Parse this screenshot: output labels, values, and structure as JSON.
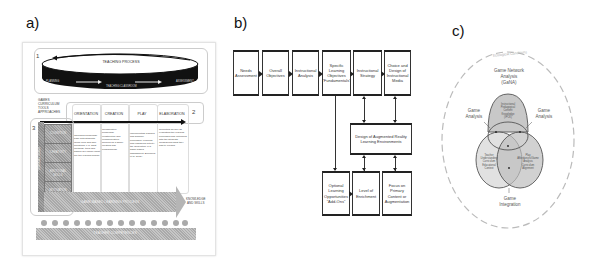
{
  "panels": {
    "a": {
      "label": "a)",
      "step_numbers": [
        "1",
        "2",
        "3"
      ],
      "disc": {
        "title": "TEACHING PROCESS",
        "bottom_label": "TEACHING CLASSROOM",
        "left_label": "PLANNING",
        "right_label": "ASSESSMENT"
      },
      "left_header": [
        "GAMES",
        "CURRICULUM",
        "TOOLS",
        "APPROACHES"
      ],
      "columns": [
        "ORIENTATION",
        "CREATION",
        "PLAY",
        "ELABORATION"
      ],
      "side_vertical_label": "LEARNING GOALS",
      "side_cells": [
        "COGNITION",
        "CREATIVITY",
        "EMOTIONAL SKILLS",
        "MOTIVATION SKILLS"
      ],
      "column_texts": [
        "Choosing knowledge base with students' ideas; how and who questions, e.g. what methods, tools and games are used? What are the learning goals?",
        "Collaborative knowledge construction and communication: working as a game-creating and programming.",
        "Implementing planned and gameful processes. Learning and reshaping activity; the generation (e.g. game-based assessment; Bleumers et al. 2011)",
        "Reflecting as well as evaluating the learning processes and outcomes with the students. Considering what they had to expand."
      ],
      "big_arrow_label": "GAME-BASED LEARNING PROCESS",
      "arrow_end_label": [
        "KNOWLEDGE",
        "AND SKILLS"
      ],
      "bottom_bar_label": "TEACHER COMPETENCES",
      "star_count": 14
    },
    "b": {
      "label": "b)",
      "top_row": [
        "Needs Assessment",
        "Overall Objectives",
        "Instructional Analysis",
        "Specific Learning Objectives \"Fundamentals\"",
        "Instructional Strategy",
        "Choice and Design of Instructional Media"
      ],
      "center_box": "Design of Augmented Reality Learning Environments",
      "bottom_row": [
        "Optional Learning Opportunities \"Add-Ons\"",
        "Level of Enrichment",
        "Focus on Primary Content or Augmentation"
      ]
    },
    "c": {
      "label": "c)",
      "outer_label": "Ecological Conditions",
      "top_title": [
        "Game Network",
        "Analysis",
        "(GaNA)"
      ],
      "left_label": [
        "Game",
        "Analysis"
      ],
      "right_label": [
        "Game",
        "Analysis"
      ],
      "bottom_label": [
        "Game",
        "Integration"
      ],
      "top_circle_text": [
        "Instructional",
        "Pedagogical",
        "Content",
        "Knowledge",
        "(IPCK)"
      ],
      "left_circle_text": [
        "Teacher",
        "Understanding",
        "Curriculum",
        "Educational",
        "Context"
      ],
      "right_circle_text": [
        "Play",
        "Affordances/Game",
        "Analysis",
        "Curriculum",
        "Alignment"
      ],
      "colors": {
        "top_fill": "#c8c8c8",
        "left_fill": "#dcdcdc",
        "right_fill": "#bdbdbd",
        "outline": "#555555",
        "dashed_outer": "#bbbbbb"
      }
    }
  }
}
